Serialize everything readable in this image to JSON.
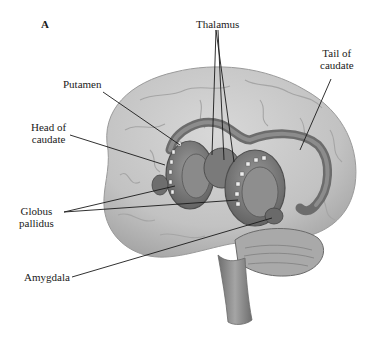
{
  "figure": {
    "panel_letter": "A",
    "labels": {
      "thalamus": "Thalamus",
      "tail_of_caudate_line1": "Tail of",
      "tail_of_caudate_line2": "caudate",
      "putamen": "Putamen",
      "head_of_caudate_line1": "Head of",
      "head_of_caudate_line2": "caudate",
      "globus_pallidus_line1": "Globus",
      "globus_pallidus_line2": "pallidus",
      "amygdala": "Amygdala"
    },
    "colors": {
      "cortex": "#c9c9c9",
      "cortex_shade": "#a8a8a8",
      "basal_ganglia": "#7d7d7d",
      "basal_ganglia_dark": "#5e5e5e",
      "brainstem": "#8f8f8f",
      "leader_line": "#1a1a1a",
      "background": "#ffffff"
    }
  }
}
